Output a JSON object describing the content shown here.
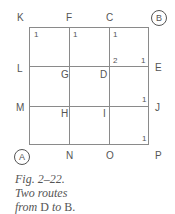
{
  "labels": {
    "K": "K",
    "F": "F",
    "C": "C",
    "B": "B",
    "L": "L",
    "G": "G",
    "D": "D",
    "E": "E",
    "M": "M",
    "H": "H",
    "I": "I",
    "J": "J",
    "A": "A",
    "N": "N",
    "O": "O",
    "P": "P"
  },
  "counts": {
    "k_cell": "1",
    "f_cell": "1",
    "c_cell": "1",
    "d_corner": "2",
    "e_corner": "1",
    "j_corner": "1",
    "p_corner": "1"
  },
  "caption": {
    "line1": "Fig. 2–22.",
    "line2": "Two routes",
    "line3_a": "from ",
    "line3_b": "D",
    "line3_c": " to ",
    "line3_d": "B",
    "line3_e": "."
  }
}
